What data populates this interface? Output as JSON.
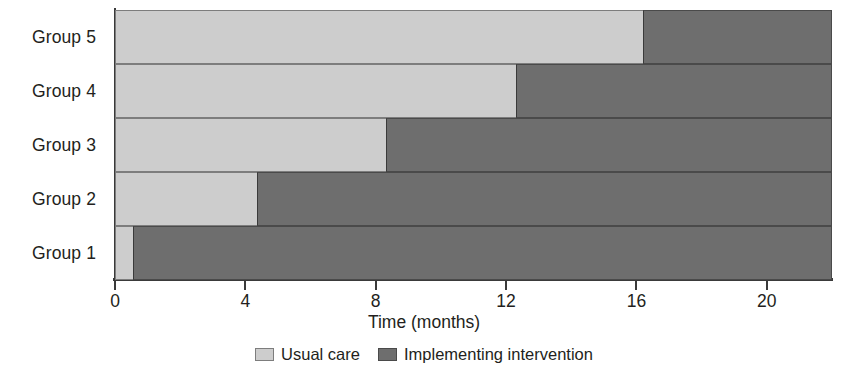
{
  "chart_data": {
    "type": "bar",
    "subtype": "stacked-horizontal",
    "title": "",
    "xlabel": "Time (months)",
    "ylabel": "",
    "xlim": [
      0,
      22
    ],
    "ylim": null,
    "grid": false,
    "orientation": "horizontal",
    "stacked": true,
    "legend_position": "bottom-center",
    "xticks": [
      0,
      4,
      8,
      12,
      16,
      20
    ],
    "xtick_labels": [
      "0",
      "4",
      "8",
      "12",
      "16",
      "20"
    ],
    "categories": [
      "Group 5",
      "Group 4",
      "Group 3",
      "Group 2",
      "Group 1"
    ],
    "series": [
      {
        "name": "Usual care",
        "color": "#cdcdcd",
        "values": [
          16.2,
          12.3,
          8.3,
          4.35,
          0.55
        ]
      },
      {
        "name": "Implementing intervention",
        "color": "#6e6e6e",
        "values": [
          5.8,
          9.7,
          13.7,
          17.65,
          21.45
        ]
      }
    ],
    "legend": [
      {
        "label": "Usual care",
        "color": "#cdcdcd",
        "swatch": "usual-care-swatch"
      },
      {
        "label": "Implementing intervention",
        "color": "#6e6e6e",
        "swatch": "implementing-intervention-swatch"
      }
    ]
  },
  "colors": {
    "usual_care": "#cdcdcd",
    "implementing_intervention": "#6e6e6e",
    "axis": "#3a3a3a",
    "text": "#231f20",
    "background": "#ffffff"
  }
}
